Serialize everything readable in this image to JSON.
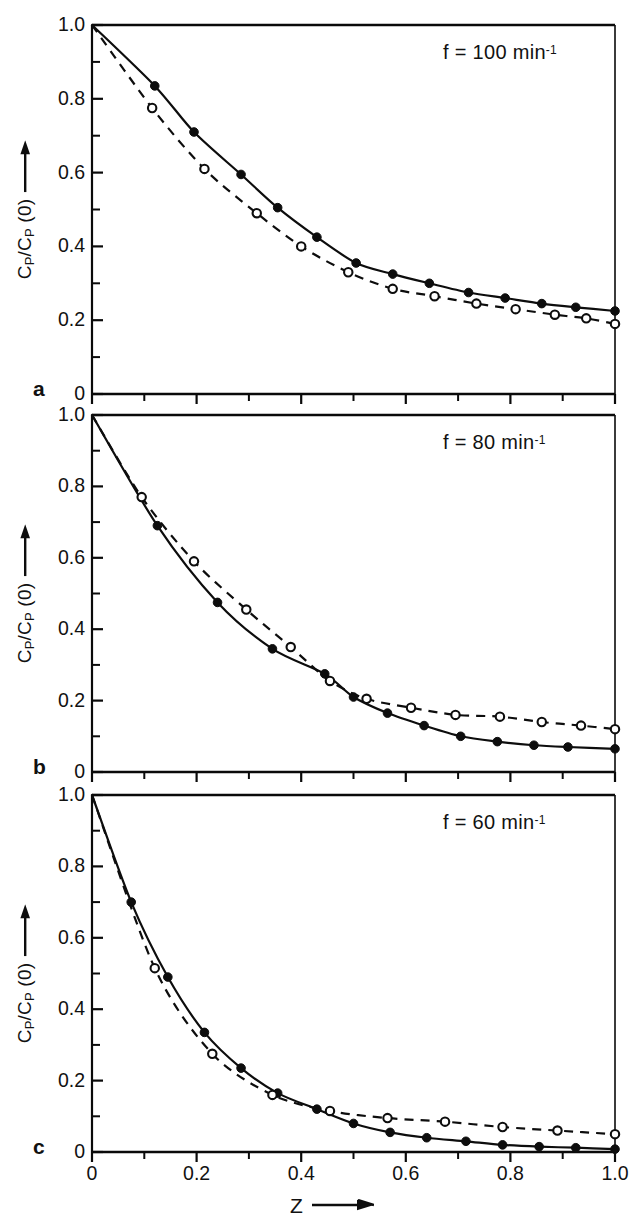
{
  "figure": {
    "background": "#ffffff",
    "ink_color": "#0d0d0d",
    "panels": [
      {
        "letter": "a",
        "annotation": "f = 100 min",
        "annotation_exponent": "-1",
        "frequency_value": 100,
        "frequency_unit": "min^-1"
      },
      {
        "letter": "b",
        "annotation": "f = 80 min",
        "annotation_exponent": "-1",
        "frequency_value": 80,
        "frequency_unit": "min^-1"
      },
      {
        "letter": "c",
        "annotation": "f = 60 min",
        "annotation_exponent": "-1",
        "frequency_value": 60,
        "frequency_unit": "min^-1"
      }
    ],
    "y_axis": {
      "label_numerator": "C",
      "label_numerator_sub": "P",
      "label_denominator": "C",
      "label_denominator_sub": "P",
      "label_suffix": "(0)",
      "label_plain": "CP/CP(0)",
      "arrow": "up",
      "tick_labels": [
        "0",
        "0.2",
        "0.4",
        "0.6",
        "0.8",
        "1.0"
      ],
      "tick_values": [
        0,
        0.2,
        0.4,
        0.6,
        0.8,
        1.0
      ],
      "minor_tick_values": [
        0.1,
        0.3,
        0.5,
        0.7,
        0.9
      ],
      "range": [
        0,
        1.0
      ]
    },
    "x_axis": {
      "label": "Z",
      "arrow": "right",
      "tick_labels": [
        "0",
        "0.2",
        "0.4",
        "0.6",
        "0.8",
        "1.0"
      ],
      "tick_values": [
        0,
        0.2,
        0.4,
        0.6,
        0.8,
        1.0
      ],
      "minor_tick_values": [
        0.1,
        0.3,
        0.5,
        0.7,
        0.9
      ],
      "range": [
        0,
        1.0
      ]
    }
  },
  "chart_data": [
    {
      "type": "line",
      "panel": "a",
      "title": "f = 100 min^-1",
      "xlabel": "Z",
      "ylabel": "CP/CP(0)",
      "xlim": [
        0,
        1.0
      ],
      "ylim": [
        0,
        1.0
      ],
      "grid": false,
      "legend": "none",
      "series": [
        {
          "name": "filled-circles-solid-line",
          "marker": "filled-circle",
          "linestyle": "solid",
          "x": [
            0.0,
            0.12,
            0.195,
            0.285,
            0.355,
            0.43,
            0.505,
            0.575,
            0.645,
            0.72,
            0.79,
            0.86,
            0.925,
            1.0
          ],
          "y": [
            1.0,
            0.835,
            0.71,
            0.595,
            0.505,
            0.425,
            0.355,
            0.325,
            0.3,
            0.275,
            0.26,
            0.245,
            0.235,
            0.225
          ]
        },
        {
          "name": "open-circles-dashed-line",
          "marker": "open-circle",
          "linestyle": "dashed",
          "x": [
            0.0,
            0.115,
            0.215,
            0.315,
            0.4,
            0.49,
            0.575,
            0.655,
            0.735,
            0.81,
            0.885,
            0.945,
            1.0
          ],
          "y": [
            1.0,
            0.775,
            0.61,
            0.49,
            0.4,
            0.33,
            0.285,
            0.265,
            0.245,
            0.23,
            0.215,
            0.205,
            0.19
          ]
        }
      ]
    },
    {
      "type": "line",
      "panel": "b",
      "title": "f = 80 min^-1",
      "xlabel": "Z",
      "ylabel": "CP/CP(0)",
      "xlim": [
        0,
        1.0
      ],
      "ylim": [
        0,
        1.0
      ],
      "grid": false,
      "legend": "none",
      "series": [
        {
          "name": "filled-circles-solid-line",
          "marker": "filled-circle",
          "linestyle": "solid",
          "x": [
            0.0,
            0.125,
            0.24,
            0.345,
            0.445,
            0.5,
            0.565,
            0.635,
            0.705,
            0.775,
            0.845,
            0.91,
            1.0
          ],
          "y": [
            1.0,
            0.69,
            0.475,
            0.345,
            0.275,
            0.21,
            0.165,
            0.13,
            0.1,
            0.085,
            0.075,
            0.07,
            0.065
          ]
        },
        {
          "name": "open-circles-dashed-line",
          "marker": "open-circle",
          "linestyle": "dashed",
          "x": [
            0.0,
            0.095,
            0.195,
            0.295,
            0.38,
            0.455,
            0.525,
            0.61,
            0.695,
            0.78,
            0.86,
            0.935,
            1.0
          ],
          "y": [
            1.0,
            0.77,
            0.59,
            0.455,
            0.35,
            0.255,
            0.205,
            0.18,
            0.16,
            0.155,
            0.14,
            0.13,
            0.12
          ]
        }
      ]
    },
    {
      "type": "line",
      "panel": "c",
      "title": "f = 60 min^-1",
      "xlabel": "Z",
      "ylabel": "CP/CP(0)",
      "xlim": [
        0,
        1.0
      ],
      "ylim": [
        0,
        1.0
      ],
      "grid": false,
      "legend": "none",
      "series": [
        {
          "name": "filled-circles-solid-line",
          "marker": "filled-circle",
          "linestyle": "solid",
          "x": [
            0.0,
            0.075,
            0.145,
            0.215,
            0.285,
            0.355,
            0.43,
            0.5,
            0.57,
            0.64,
            0.715,
            0.785,
            0.855,
            0.925,
            1.0
          ],
          "y": [
            1.0,
            0.7,
            0.49,
            0.335,
            0.235,
            0.165,
            0.12,
            0.08,
            0.055,
            0.04,
            0.03,
            0.02,
            0.015,
            0.012,
            0.008
          ]
        },
        {
          "name": "open-circles-dashed-line",
          "marker": "open-circle",
          "linestyle": "dashed",
          "x": [
            0.0,
            0.12,
            0.23,
            0.345,
            0.455,
            0.565,
            0.675,
            0.785,
            0.89,
            1.0
          ],
          "y": [
            1.0,
            0.515,
            0.275,
            0.16,
            0.115,
            0.095,
            0.085,
            0.07,
            0.06,
            0.05
          ]
        }
      ]
    }
  ]
}
